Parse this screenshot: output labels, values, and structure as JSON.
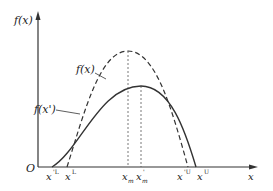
{
  "diagram": {
    "y_axis_label": "f(x)",
    "x_axis_label": "x",
    "origin_label": "O",
    "curves": [
      {
        "name": "f(x)",
        "label": "f(x)",
        "style": "dashed",
        "color": "#333333"
      },
      {
        "name": "f(x')",
        "label": "f(x')",
        "style": "solid",
        "color": "#333333"
      }
    ],
    "x_ticks": [
      {
        "base": "x",
        "sup": "'L",
        "sub": ""
      },
      {
        "base": "x",
        "sup": "L",
        "sub": ""
      },
      {
        "base": "x",
        "sup": "",
        "sub": "m"
      },
      {
        "base": "x",
        "sup": "'",
        "sub": "m"
      },
      {
        "base": "x",
        "sup": "'U",
        "sub": ""
      },
      {
        "base": "x",
        "sup": "U",
        "sub": ""
      }
    ]
  }
}
